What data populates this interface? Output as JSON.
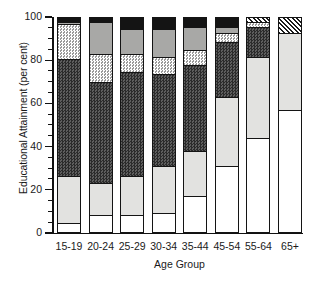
{
  "chart_data": {
    "type": "bar",
    "title": "",
    "xlabel": "Age Group",
    "ylabel": "Educational Attainment (per cent)",
    "stacked": true,
    "normalized_percent": true,
    "ylim": [
      0,
      100
    ],
    "yticks": [
      0,
      20,
      40,
      60,
      80,
      100
    ],
    "ytick_labels": [
      "0",
      "20",
      "40",
      "60",
      "80",
      "100"
    ],
    "grid": false,
    "legend_position": "none",
    "categories": [
      "15-19",
      "20-24",
      "25-29",
      "30-34",
      "35-44",
      "45-54",
      "55-64",
      "65+"
    ],
    "series": [
      {
        "name": "level-1",
        "fill": "white",
        "values": [
          4,
          8,
          8,
          9,
          17,
          31,
          44,
          57
        ]
      },
      {
        "name": "level-2",
        "fill": "light-gray",
        "values": [
          22,
          15,
          18,
          22,
          21,
          32,
          38,
          36
        ]
      },
      {
        "name": "level-3",
        "fill": "dark-checkered",
        "values": [
          55,
          47,
          49,
          43,
          40,
          26,
          14,
          0
        ]
      },
      {
        "name": "level-4",
        "fill": "light-checkered",
        "values": [
          16,
          13,
          8,
          8,
          7,
          4,
          2,
          0
        ]
      },
      {
        "name": "level-5",
        "fill": "medium-gray",
        "values": [
          1,
          15,
          12,
          13,
          11,
          3,
          0,
          0
        ]
      },
      {
        "name": "level-6",
        "fill": "black",
        "values": [
          2,
          2,
          5,
          5,
          4,
          4,
          0,
          0
        ]
      },
      {
        "name": "level-7",
        "fill": "diagonal-hatch",
        "values": [
          0,
          0,
          0,
          0,
          0,
          0,
          2,
          7
        ]
      }
    ]
  },
  "axes": {
    "y_title": "Educational Attainment (per cent)",
    "x_title": "Age Group"
  }
}
